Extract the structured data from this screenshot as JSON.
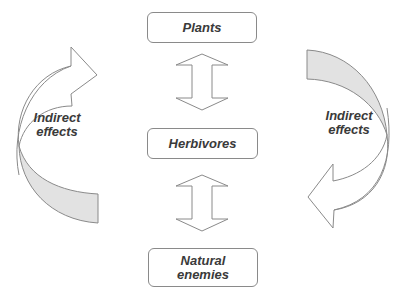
{
  "diagram": {
    "nodes": {
      "plants": {
        "label": "Plants"
      },
      "herbivores": {
        "label": "Herbivores"
      },
      "natural_enemies": {
        "line1": "Natural",
        "line2": "enemies"
      }
    },
    "left_cycle": {
      "line1": "Indirect",
      "line2": "effects"
    },
    "right_cycle": {
      "line1": "Indirect",
      "line2": "effects"
    },
    "colors": {
      "stroke": "#8a8a8a",
      "shade": "#e2e2e2",
      "text": "#3a3a3a"
    }
  }
}
